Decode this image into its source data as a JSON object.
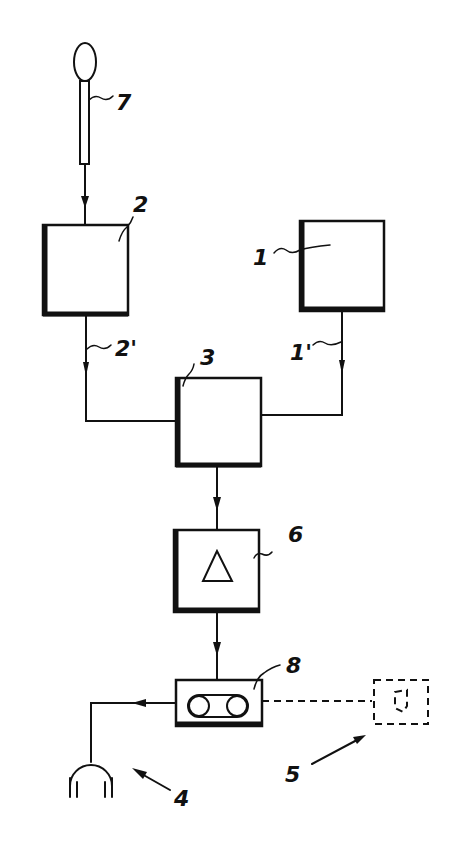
{
  "diagram": {
    "type": "block-diagram",
    "style": "patent drawing, black line art on white",
    "labels": {
      "block_1": "1",
      "line_1p": "1'",
      "block_2": "2",
      "line_2p": "2'",
      "block_3": "3",
      "headphones_4": "4",
      "remote_5": "5",
      "amplifier_6": "6",
      "microphone_7": "7",
      "cassette_8": "8"
    },
    "components": [
      {
        "id": "1",
        "shape": "box",
        "description": "signal source block"
      },
      {
        "id": "2",
        "shape": "box",
        "description": "block fed by microphone 7"
      },
      {
        "id": "3",
        "shape": "box",
        "description": "combiner/mixer block receiving 1' and 2'"
      },
      {
        "id": "4",
        "shape": "headphones",
        "description": "headphones"
      },
      {
        "id": "5",
        "shape": "dashed box",
        "description": "optional remote device (dashed)"
      },
      {
        "id": "6",
        "shape": "box with triangle",
        "description": "amplifier"
      },
      {
        "id": "7",
        "shape": "microphone",
        "description": "microphone"
      },
      {
        "id": "8",
        "shape": "box with tape symbol",
        "description": "cassette recorder"
      }
    ],
    "connections": [
      {
        "from": "7",
        "to": "2",
        "arrow": true
      },
      {
        "from": "2",
        "to": "3",
        "via": "2'",
        "arrow": true
      },
      {
        "from": "1",
        "to": "3",
        "via": "1'",
        "arrow": true
      },
      {
        "from": "3",
        "to": "6",
        "arrow": true
      },
      {
        "from": "6",
        "to": "8",
        "arrow": true
      },
      {
        "from": "8",
        "to": "4",
        "arrow": true
      },
      {
        "from": "8",
        "to": "5",
        "style": "dashed"
      }
    ],
    "colors": {
      "ink": "#111111",
      "paper": "#ffffff"
    }
  }
}
